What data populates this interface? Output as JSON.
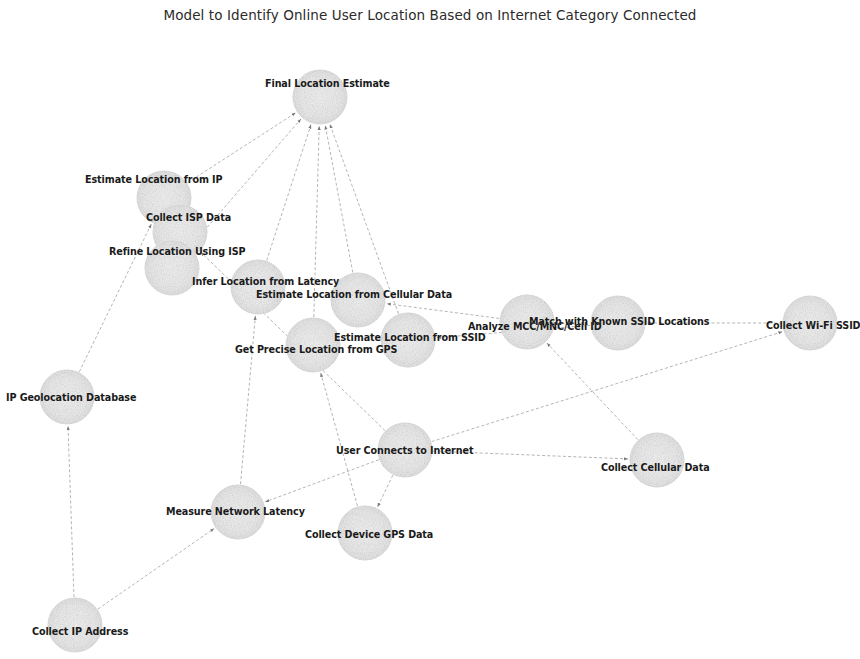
{
  "title": "Model to Identify Online User Location Based on Internet Category Connected",
  "style": {
    "background": "#ffffff",
    "node_fill": "#efefef",
    "node_edge": "#e2e2e2",
    "edge_color": "#8a8a8a",
    "label_color": "#1a1a1a",
    "title_color": "#2b2b2b"
  },
  "chart_data": {
    "type": "diagram",
    "subtype": "directed-network-graph",
    "title": "Model to Identify Online User Location Based on Internet Category Connected",
    "node_radius": 27,
    "nodes": [
      {
        "id": "final_location_estimate",
        "label": "Final Location Estimate",
        "x": 320,
        "y": 97,
        "label_x": 265,
        "label_y": 79
      },
      {
        "id": "estimate_location_from_ip",
        "label": "Estimate Location from IP",
        "x": 164,
        "y": 198,
        "label_x": 85,
        "label_y": 175
      },
      {
        "id": "collect_isp_data",
        "label": "Collect ISP Data",
        "x": 180,
        "y": 232,
        "label_x": 146,
        "label_y": 213
      },
      {
        "id": "refine_location_using_isp",
        "label": "Refine Location Using ISP",
        "x": 172,
        "y": 268,
        "label_x": 109,
        "label_y": 247
      },
      {
        "id": "infer_location_from_latency",
        "label": "Infer Location from Latency",
        "x": 258,
        "y": 287,
        "label_x": 192,
        "label_y": 277
      },
      {
        "id": "estimate_location_from_cellular_data",
        "label": "Estimate Location from Cellular Data",
        "x": 358,
        "y": 300,
        "label_x": 256,
        "label_y": 290
      },
      {
        "id": "get_precise_location_from_gps",
        "label": "Get Precise Location from GPS",
        "x": 313,
        "y": 345,
        "label_x": 235,
        "label_y": 345
      },
      {
        "id": "estimate_location_from_ssid",
        "label": "Estimate Location from SSID",
        "x": 408,
        "y": 340,
        "label_x": 334,
        "label_y": 333
      },
      {
        "id": "analyze_mcc_mnc_cell_id",
        "label": "Analyze MCC/MNC/Cell ID",
        "x": 527,
        "y": 322,
        "label_x": 468,
        "label_y": 322
      },
      {
        "id": "match_with_known_ssid_locations",
        "label": "Match with Known SSID Locations",
        "x": 618,
        "y": 323,
        "label_x": 529,
        "label_y": 317
      },
      {
        "id": "collect_wifi_ssid",
        "label": "Collect Wi-Fi SSID",
        "x": 810,
        "y": 323,
        "label_x": 766,
        "label_y": 321
      },
      {
        "id": "ip_geolocation_database",
        "label": "IP Geolocation Database",
        "x": 67,
        "y": 397,
        "label_x": 6,
        "label_y": 393
      },
      {
        "id": "user_connects_to_internet",
        "label": "User Connects to Internet",
        "x": 405,
        "y": 450,
        "label_x": 336,
        "label_y": 446
      },
      {
        "id": "collect_cellular_data",
        "label": "Collect Cellular Data",
        "x": 657,
        "y": 460,
        "label_x": 601,
        "label_y": 463
      },
      {
        "id": "measure_network_latency",
        "label": "Measure Network Latency",
        "x": 238,
        "y": 512,
        "label_x": 166,
        "label_y": 507
      },
      {
        "id": "collect_device_gps_data",
        "label": "Collect Device GPS Data",
        "x": 365,
        "y": 533,
        "label_x": 305,
        "label_y": 530
      },
      {
        "id": "collect_ip_address",
        "label": "Collect IP Address",
        "x": 75,
        "y": 625,
        "label_x": 32,
        "label_y": 627
      }
    ],
    "edges": [
      {
        "from": "estimate_location_from_ip",
        "to": "final_location_estimate"
      },
      {
        "from": "refine_location_using_isp",
        "to": "final_location_estimate"
      },
      {
        "from": "infer_location_from_latency",
        "to": "final_location_estimate"
      },
      {
        "from": "estimate_location_from_cellular_data",
        "to": "final_location_estimate"
      },
      {
        "from": "get_precise_location_from_gps",
        "to": "final_location_estimate"
      },
      {
        "from": "estimate_location_from_ssid",
        "to": "final_location_estimate"
      },
      {
        "from": "collect_ip_address",
        "to": "ip_geolocation_database"
      },
      {
        "from": "ip_geolocation_database",
        "to": "estimate_location_from_ip"
      },
      {
        "from": "collect_isp_data",
        "to": "refine_location_using_isp"
      },
      {
        "from": "user_connects_to_internet",
        "to": "collect_isp_data"
      },
      {
        "from": "collect_ip_address",
        "to": "measure_network_latency"
      },
      {
        "from": "measure_network_latency",
        "to": "infer_location_from_latency"
      },
      {
        "from": "user_connects_to_internet",
        "to": "measure_network_latency"
      },
      {
        "from": "user_connects_to_internet",
        "to": "collect_device_gps_data"
      },
      {
        "from": "collect_device_gps_data",
        "to": "get_precise_location_from_gps"
      },
      {
        "from": "user_connects_to_internet",
        "to": "collect_cellular_data"
      },
      {
        "from": "collect_cellular_data",
        "to": "analyze_mcc_mnc_cell_id"
      },
      {
        "from": "analyze_mcc_mnc_cell_id",
        "to": "estimate_location_from_cellular_data"
      },
      {
        "from": "user_connects_to_internet",
        "to": "collect_wifi_ssid"
      },
      {
        "from": "collect_wifi_ssid",
        "to": "match_with_known_ssid_locations"
      },
      {
        "from": "match_with_known_ssid_locations",
        "to": "estimate_location_from_ssid"
      }
    ]
  }
}
